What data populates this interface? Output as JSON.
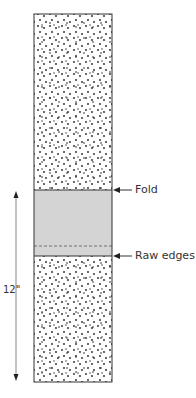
{
  "diagram": {
    "labels": {
      "fold": "Fold",
      "raw_edges": "Raw edges",
      "height": "12\""
    },
    "colors": {
      "outline": "#333333",
      "dots": "#222222",
      "fold_band": "#d4d4d4",
      "background": "#ffffff"
    },
    "geometry": {
      "rect": {
        "x": 34,
        "y": 14,
        "w": 78,
        "h": 368
      },
      "fold_y": 190,
      "dashed_y": 246,
      "raw_edges_y": 256,
      "dimension_arrow": {
        "x": 16,
        "y1": 192,
        "y2": 380
      }
    }
  }
}
